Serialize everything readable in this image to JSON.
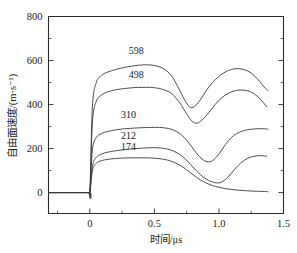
{
  "figure": {
    "background": "#ffffff",
    "ink_color": "#2b2b2b",
    "top_edge_artifact": "·· ··· ·· ···· ·· ··· ····· ·· ····"
  },
  "axes": {
    "x_title": "时间/μs",
    "y_title": "自由面速度/(m·s⁻¹)",
    "x_ticklabels": [
      "0",
      "0.5",
      "1.0",
      "1.5"
    ],
    "x_tickvalues": [
      0,
      0.5,
      1.0,
      1.5
    ],
    "y_ticklabels": [
      "0",
      "200",
      "400",
      "600",
      "800"
    ],
    "y_tickvalues": [
      0,
      200,
      400,
      600,
      800
    ],
    "x_min": -0.32,
    "x_max": 1.5,
    "y_min": -95,
    "y_max": 800,
    "grid": false,
    "minor_ticks_x": 1,
    "minor_ticks_y": 1
  },
  "chart_data": {
    "type": "line",
    "title": "",
    "subtitle": "",
    "xlabel": "时间/μs",
    "ylabel": "自由面速度/(m·s⁻¹)",
    "xlim": [
      -0.32,
      1.5
    ],
    "ylim": [
      -95,
      800
    ],
    "legend_position": "inline-curve-labels",
    "annotations": [
      {
        "text": "598",
        "x": 0.36,
        "y": 628
      },
      {
        "text": "498",
        "x": 0.36,
        "y": 520
      },
      {
        "text": "310",
        "x": 0.3,
        "y": 338
      },
      {
        "text": "212",
        "x": 0.3,
        "y": 243
      },
      {
        "text": "174",
        "x": 0.3,
        "y": 193
      }
    ],
    "series": [
      {
        "name": "598",
        "label": "598",
        "color": "#3a3a3a",
        "x": [
          -0.32,
          -0.02,
          0.0,
          0.02,
          0.05,
          0.09,
          0.14,
          0.2,
          0.27,
          0.34,
          0.41,
          0.47,
          0.52,
          0.57,
          0.62,
          0.66,
          0.7,
          0.74,
          0.78,
          0.82,
          0.86,
          0.9,
          0.95,
          1.0,
          1.05,
          1.1,
          1.15,
          1.2,
          1.25,
          1.3,
          1.35,
          1.38
        ],
        "y": [
          0,
          0,
          0,
          390,
          500,
          532,
          548,
          559,
          569,
          576,
          580,
          580,
          575,
          563,
          540,
          505,
          460,
          415,
          386,
          396,
          425,
          462,
          500,
          528,
          548,
          560,
          563,
          558,
          543,
          515,
          480,
          462
        ]
      },
      {
        "name": "498",
        "label": "498",
        "color": "#3a3a3a",
        "x": [
          -0.32,
          -0.02,
          0.0,
          0.02,
          0.05,
          0.09,
          0.14,
          0.2,
          0.27,
          0.34,
          0.41,
          0.47,
          0.53,
          0.58,
          0.63,
          0.67,
          0.71,
          0.75,
          0.79,
          0.83,
          0.87,
          0.92,
          0.97,
          1.02,
          1.07,
          1.12,
          1.17,
          1.22,
          1.27,
          1.32,
          1.37
        ],
        "y": [
          0,
          0,
          0,
          320,
          415,
          443,
          458,
          467,
          473,
          477,
          478,
          478,
          474,
          466,
          452,
          428,
          396,
          358,
          325,
          315,
          330,
          362,
          400,
          430,
          450,
          462,
          466,
          463,
          450,
          425,
          390
        ]
      },
      {
        "name": "310",
        "label": "310",
        "color": "#3a3a3a",
        "x": [
          -0.32,
          -0.02,
          0.0,
          0.02,
          0.05,
          0.09,
          0.14,
          0.2,
          0.27,
          0.34,
          0.41,
          0.48,
          0.54,
          0.59,
          0.63,
          0.67,
          0.71,
          0.75,
          0.79,
          0.83,
          0.87,
          0.91,
          0.95,
          1.0,
          1.05,
          1.1,
          1.15,
          1.2,
          1.25,
          1.3,
          1.35,
          1.38
        ],
        "y": [
          0,
          0,
          0,
          195,
          250,
          268,
          278,
          285,
          290,
          293,
          295,
          296,
          296,
          293,
          288,
          278,
          262,
          238,
          208,
          176,
          152,
          140,
          145,
          175,
          218,
          252,
          272,
          283,
          288,
          290,
          290,
          288
        ]
      },
      {
        "name": "212",
        "label": "212",
        "color": "#3a3a3a",
        "x": [
          -0.32,
          -0.02,
          0.0,
          0.02,
          0.05,
          0.09,
          0.14,
          0.2,
          0.27,
          0.34,
          0.41,
          0.48,
          0.54,
          0.6,
          0.65,
          0.7,
          0.74,
          0.78,
          0.82,
          0.86,
          0.9,
          0.94,
          0.98,
          1.02,
          1.07,
          1.12,
          1.17,
          1.22,
          1.27,
          1.32,
          1.37
        ],
        "y": [
          0,
          0,
          0,
          120,
          160,
          175,
          184,
          190,
          195,
          199,
          202,
          204,
          203,
          198,
          188,
          172,
          152,
          128,
          103,
          80,
          62,
          50,
          44,
          48,
          70,
          105,
          135,
          155,
          165,
          168,
          165
        ]
      },
      {
        "name": "174",
        "label": "174",
        "color": "#3a3a3a",
        "x": [
          -0.32,
          -0.02,
          0.0,
          0.02,
          0.05,
          0.09,
          0.14,
          0.2,
          0.27,
          0.34,
          0.41,
          0.48,
          0.54,
          0.6,
          0.65,
          0.7,
          0.74,
          0.78,
          0.82,
          0.86,
          0.9,
          0.95,
          1.0,
          1.05,
          1.1,
          1.15,
          1.2,
          1.25,
          1.3,
          1.35,
          1.38
        ],
        "y": [
          0,
          0,
          0,
          100,
          133,
          145,
          151,
          155,
          157,
          158,
          158,
          157,
          154,
          148,
          138,
          124,
          108,
          90,
          72,
          56,
          44,
          32,
          24,
          18,
          14,
          11,
          9,
          7,
          6,
          5,
          4
        ]
      }
    ]
  }
}
